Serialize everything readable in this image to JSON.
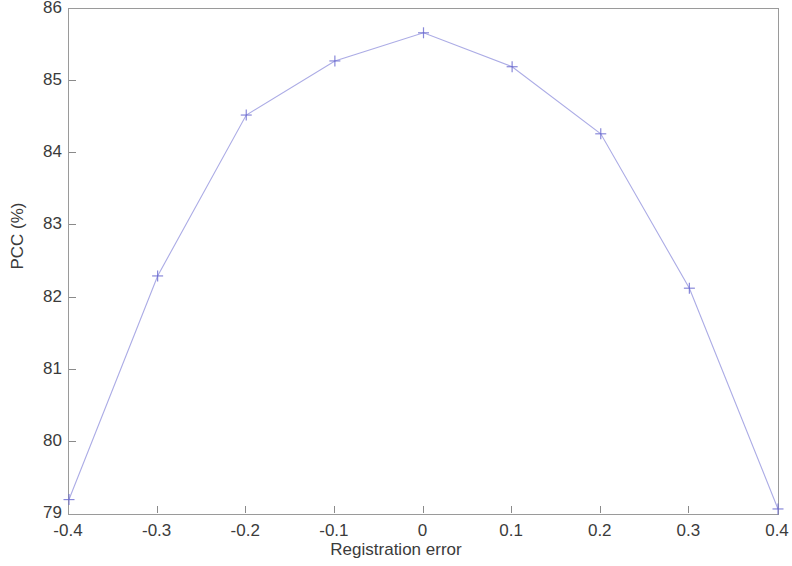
{
  "chart_data": {
    "type": "line",
    "title": "",
    "subtitle": "",
    "xlabel": "Registration error",
    "ylabel": "PCC (%)",
    "xlim": [
      -0.4,
      0.4
    ],
    "ylim": [
      79,
      86
    ],
    "xticks": [
      -0.4,
      -0.3,
      -0.2,
      -0.1,
      0,
      0.1,
      0.2,
      0.3,
      0.4
    ],
    "xtick_labels": [
      "-0.4",
      "-0.3",
      "-0.2",
      "-0.1",
      "0",
      "0.1",
      "0.2",
      "0.3",
      "0.4"
    ],
    "yticks": [
      79,
      80,
      81,
      82,
      83,
      84,
      85,
      86
    ],
    "ytick_labels": [
      "79",
      "80",
      "81",
      "82",
      "83",
      "84",
      "85",
      "86"
    ],
    "grid": false,
    "legend": null,
    "legend_position": "none",
    "line_color": "#8f8fdc",
    "marker": "+",
    "marker_color": "#6a6ad0",
    "x": [
      -0.4,
      -0.3,
      -0.2,
      -0.1,
      0,
      0.1,
      0.2,
      0.3,
      0.4
    ],
    "values": [
      79.2,
      82.3,
      84.53,
      85.28,
      85.67,
      85.2,
      84.27,
      82.13,
      79.07
    ],
    "series": [
      {
        "name": "PCC vs registration error",
        "x": [
          -0.4,
          -0.3,
          -0.2,
          -0.1,
          0,
          0.1,
          0.2,
          0.3,
          0.4
        ],
        "values": [
          79.2,
          82.3,
          84.53,
          85.28,
          85.67,
          85.2,
          84.27,
          82.13,
          79.07
        ]
      }
    ],
    "annotations": []
  }
}
